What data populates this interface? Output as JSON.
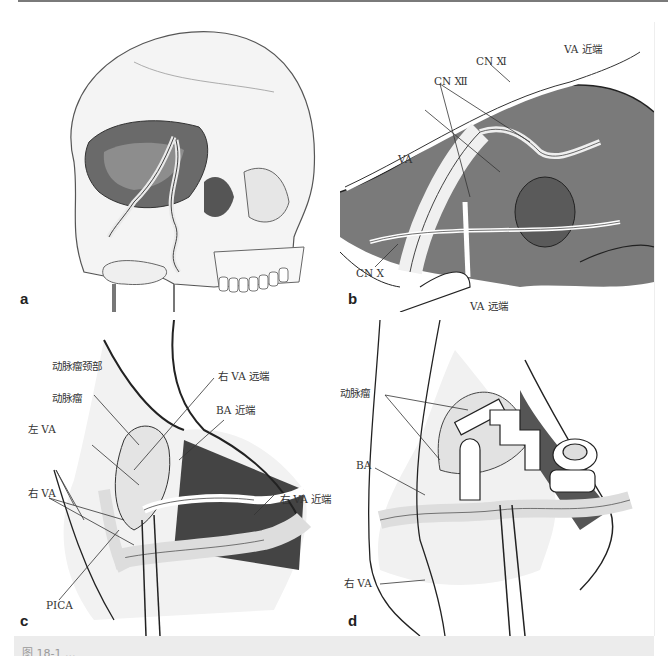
{
  "figure": {
    "panels": [
      {
        "id": "a",
        "letter": "a",
        "description": "Skull illustration, lateral oblique view with posterior fossa opened showing vertebral artery course",
        "labels": []
      },
      {
        "id": "b",
        "letter": "b",
        "description": "Far-lateral exposure showing vertebral artery and lower cranial nerves",
        "labels": [
          "VA 近端",
          "CN Ⅺ",
          "CN Ⅻ",
          "VA",
          "CN Ⅹ",
          "VA 远端"
        ]
      },
      {
        "id": "c",
        "letter": "c",
        "description": "Aneurysm neck exposure with bilateral vertebral arteries",
        "labels": [
          "动脉瘤颈部",
          "右 VA 远端",
          "动脉瘤",
          "BA 近端",
          "左 VA",
          "右 VA",
          "右 VA 近端",
          "PICA"
        ]
      },
      {
        "id": "d",
        "letter": "d",
        "description": "Aneurysm after clip application",
        "labels": [
          "动脉瘤",
          "BA",
          "右 VA"
        ]
      }
    ],
    "caption": "图 18-1 ..."
  },
  "colors": {
    "ink": "#222222",
    "label": "#333333",
    "caption_band": "#ececec",
    "top_rule": "#7a7a7a"
  }
}
